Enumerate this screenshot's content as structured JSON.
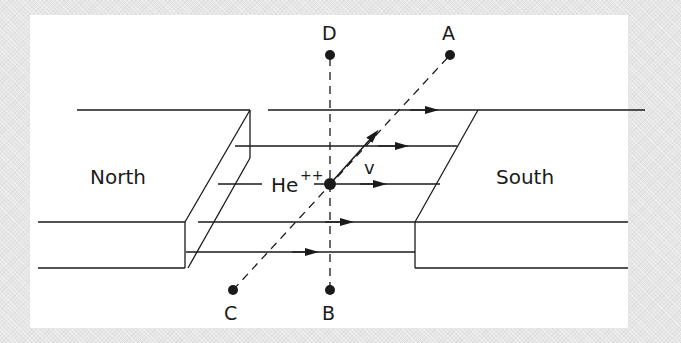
{
  "diagram": {
    "magnets": {
      "north_label": "North",
      "south_label": "South"
    },
    "particle": {
      "symbol": "He",
      "charge": "++",
      "velocity_label": "v"
    },
    "points": {
      "A": "A",
      "B": "B",
      "C": "C",
      "D": "D"
    },
    "field_lines_count": 5,
    "colors": {
      "line": "#1a1a1a",
      "panel": "#ffffff",
      "background": "#e6e6e6"
    }
  }
}
